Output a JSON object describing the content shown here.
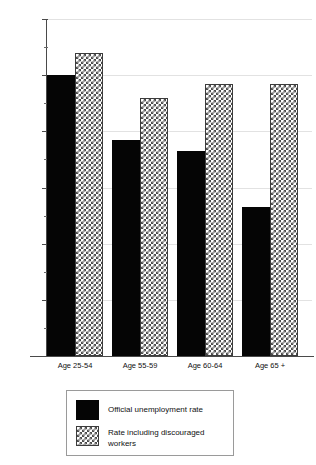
{
  "chart_data": {
    "type": "bar",
    "title": "",
    "xlabel": "",
    "ylabel": "Unemployment rate",
    "ylim": [
      0,
      6
    ],
    "yticks": [
      0,
      1,
      2,
      3,
      4,
      5,
      6
    ],
    "ytick_labels": [
      "0",
      "1",
      "2",
      "3",
      "4",
      "5",
      "6"
    ],
    "minor_ticks": [
      0.5,
      1.5,
      2.5,
      3.5,
      4.5,
      5.5
    ],
    "grid": "horizontal-light",
    "legend_position": "below-center",
    "categories": [
      "Age 25-54",
      "Age 55-59",
      "Age 60-64",
      "Age 65 +"
    ],
    "series": [
      {
        "name": "Official unemployment rate",
        "pattern": "solid-black",
        "color": "#050505",
        "values": [
          5.0,
          3.85,
          3.65,
          2.65
        ]
      },
      {
        "name": "Rate including discouraged workers",
        "pattern": "checkerboard-hatch",
        "color": "#4d4d4d",
        "values": [
          5.4,
          4.6,
          4.85,
          4.85
        ]
      }
    ]
  },
  "axis": {
    "y_title": "Unemployment rate"
  },
  "legend": {
    "entries": [
      {
        "label": "Official unemployment rate"
      },
      {
        "label": "Rate including discouraged workers"
      }
    ]
  }
}
